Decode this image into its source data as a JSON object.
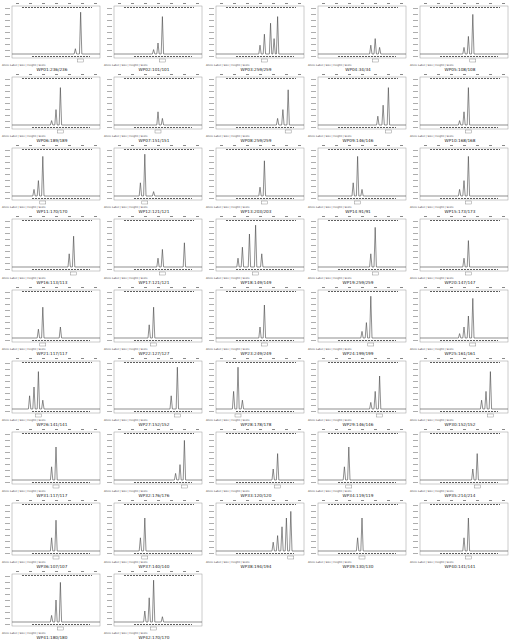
{
  "chart_data": {
    "type": "line",
    "title": "",
    "layout": {
      "columns": 5,
      "rows": 9,
      "panel_count": 42
    },
    "panel_footer_labels": [
      "Allele Label",
      "Size",
      "Height",
      "Score"
    ],
    "panels": [
      {
        "name": "WP01:236/236",
        "peaks": [
          [
            0.78,
            0.95
          ],
          [
            0.72,
            0.12
          ]
        ]
      },
      {
        "name": "WP02:101/101",
        "peaks": [
          [
            0.55,
            0.85
          ],
          [
            0.5,
            0.25
          ],
          [
            0.45,
            0.1
          ]
        ]
      },
      {
        "name": "WP03:259/259",
        "peaks": [
          [
            0.55,
            0.45
          ],
          [
            0.62,
            0.7
          ],
          [
            0.7,
            0.85
          ],
          [
            0.5,
            0.2
          ],
          [
            0.66,
            0.35
          ]
        ]
      },
      {
        "name": "WP04:34/34",
        "peaks": [
          [
            0.65,
            0.35
          ],
          [
            0.6,
            0.2
          ],
          [
            0.7,
            0.15
          ]
        ]
      },
      {
        "name": "WP05:108/108",
        "peaks": [
          [
            0.6,
            0.9
          ],
          [
            0.55,
            0.4
          ],
          [
            0.5,
            0.15
          ]
        ]
      },
      {
        "name": "WP06:189/189",
        "peaks": [
          [
            0.55,
            0.85
          ],
          [
            0.5,
            0.35
          ],
          [
            0.45,
            0.1
          ]
        ]
      },
      {
        "name": "WP07:151/151",
        "peaks": [
          [
            0.5,
            0.3
          ],
          [
            0.55,
            0.15
          ]
        ]
      },
      {
        "name": "WP08:259/259",
        "peaks": [
          [
            0.82,
            0.8
          ],
          [
            0.76,
            0.35
          ],
          [
            0.7,
            0.15
          ]
        ]
      },
      {
        "name": "WP09:146/146",
        "peaks": [
          [
            0.8,
            0.85
          ],
          [
            0.74,
            0.45
          ],
          [
            0.68,
            0.2
          ]
        ]
      },
      {
        "name": "WP10:168/168",
        "peaks": [
          [
            0.55,
            0.85
          ],
          [
            0.5,
            0.3
          ],
          [
            0.45,
            0.1
          ]
        ]
      },
      {
        "name": "WP11:170/170",
        "peaks": [
          [
            0.35,
            0.9
          ],
          [
            0.3,
            0.35
          ],
          [
            0.25,
            0.15
          ]
        ]
      },
      {
        "name": "WP12:121/121",
        "peaks": [
          [
            0.35,
            0.95
          ],
          [
            0.3,
            0.3
          ],
          [
            0.45,
            0.1
          ]
        ]
      },
      {
        "name": "WP13:203/203",
        "peaks": [
          [
            0.55,
            0.8
          ],
          [
            0.5,
            0.2
          ]
        ]
      },
      {
        "name": "WP14:91/91",
        "peaks": [
          [
            0.45,
            0.9
          ],
          [
            0.4,
            0.3
          ],
          [
            0.5,
            0.15
          ]
        ]
      },
      {
        "name": "WP15:173/173",
        "peaks": [
          [
            0.55,
            0.9
          ],
          [
            0.5,
            0.35
          ],
          [
            0.45,
            0.15
          ]
        ]
      },
      {
        "name": "WP16:113/113",
        "peaks": [
          [
            0.7,
            0.7
          ],
          [
            0.65,
            0.3
          ]
        ]
      },
      {
        "name": "WP17:121/121",
        "peaks": [
          [
            0.55,
            0.4
          ],
          [
            0.8,
            0.55
          ],
          [
            0.5,
            0.2
          ]
        ]
      },
      {
        "name": "WP18:149/149",
        "peaks": [
          [
            0.45,
            0.95
          ],
          [
            0.38,
            0.75
          ],
          [
            0.3,
            0.45
          ],
          [
            0.52,
            0.3
          ],
          [
            0.25,
            0.2
          ]
        ]
      },
      {
        "name": "WP19:259/259",
        "peaks": [
          [
            0.65,
            0.9
          ],
          [
            0.6,
            0.3
          ]
        ]
      },
      {
        "name": "WP20:147/147",
        "peaks": [
          [
            0.55,
            0.6
          ],
          [
            0.5,
            0.2
          ]
        ]
      },
      {
        "name": "WP21:117/117",
        "peaks": [
          [
            0.35,
            0.7
          ],
          [
            0.55,
            0.25
          ],
          [
            0.3,
            0.2
          ]
        ]
      },
      {
        "name": "WP22:127/127",
        "peaks": [
          [
            0.45,
            0.7
          ],
          [
            0.4,
            0.3
          ]
        ]
      },
      {
        "name": "WP23:249/249",
        "peaks": [
          [
            0.55,
            0.75
          ],
          [
            0.5,
            0.25
          ]
        ]
      },
      {
        "name": "WP24:199/199",
        "peaks": [
          [
            0.6,
            0.95
          ],
          [
            0.55,
            0.35
          ],
          [
            0.5,
            0.15
          ]
        ]
      },
      {
        "name": "WP25:161/161",
        "peaks": [
          [
            0.6,
            0.9
          ],
          [
            0.55,
            0.5
          ],
          [
            0.5,
            0.25
          ],
          [
            0.45,
            0.1
          ]
        ]
      },
      {
        "name": "WP26:141/141",
        "peaks": [
          [
            0.3,
            0.85
          ],
          [
            0.25,
            0.5
          ],
          [
            0.2,
            0.3
          ],
          [
            0.35,
            0.2
          ]
        ]
      },
      {
        "name": "WP27:152/152",
        "peaks": [
          [
            0.72,
            0.95
          ],
          [
            0.65,
            0.3
          ]
        ]
      },
      {
        "name": "WP28:178/178",
        "peaks": [
          [
            0.25,
            0.95
          ],
          [
            0.2,
            0.4
          ],
          [
            0.3,
            0.2
          ]
        ]
      },
      {
        "name": "WP29:146/146",
        "peaks": [
          [
            0.7,
            0.75
          ],
          [
            0.65,
            0.4
          ],
          [
            0.6,
            0.15
          ]
        ]
      },
      {
        "name": "WP30:152/152",
        "peaks": [
          [
            0.8,
            0.85
          ],
          [
            0.75,
            0.4
          ],
          [
            0.7,
            0.2
          ]
        ]
      },
      {
        "name": "WP31:117/117",
        "peaks": [
          [
            0.5,
            0.75
          ],
          [
            0.45,
            0.3
          ]
        ]
      },
      {
        "name": "WP32:176/176",
        "peaks": [
          [
            0.8,
            0.9
          ],
          [
            0.75,
            0.35
          ],
          [
            0.7,
            0.15
          ]
        ]
      },
      {
        "name": "WP33:120/120",
        "peaks": [
          [
            0.7,
            0.6
          ],
          [
            0.65,
            0.25
          ]
        ]
      },
      {
        "name": "WP34:119/119",
        "peaks": [
          [
            0.35,
            0.75
          ],
          [
            0.3,
            0.3
          ]
        ]
      },
      {
        "name": "WP35:214/214",
        "peaks": [
          [
            0.65,
            0.6
          ],
          [
            0.6,
            0.25
          ]
        ]
      },
      {
        "name": "WP36:107/107",
        "peaks": [
          [
            0.5,
            0.7
          ],
          [
            0.45,
            0.3
          ]
        ]
      },
      {
        "name": "WP37:140/140",
        "peaks": [
          [
            0.35,
            0.75
          ],
          [
            0.3,
            0.3
          ]
        ]
      },
      {
        "name": "WP38:194/194",
        "peaks": [
          [
            0.85,
            0.9
          ],
          [
            0.8,
            0.75
          ],
          [
            0.75,
            0.55
          ],
          [
            0.7,
            0.35
          ],
          [
            0.65,
            0.2
          ]
        ]
      },
      {
        "name": "WP39:130/130",
        "peaks": [
          [
            0.5,
            0.75
          ],
          [
            0.45,
            0.3
          ]
        ]
      },
      {
        "name": "WP40:141/141",
        "peaks": [
          [
            0.55,
            0.75
          ],
          [
            0.5,
            0.3
          ]
        ]
      },
      {
        "name": "WP41:180/180",
        "peaks": [
          [
            0.55,
            0.9
          ],
          [
            0.5,
            0.5
          ],
          [
            0.45,
            0.15
          ]
        ]
      },
      {
        "name": "WP42:170/170",
        "peaks": [
          [
            0.45,
            0.95
          ],
          [
            0.4,
            0.55
          ],
          [
            0.35,
            0.25
          ],
          [
            0.55,
            0.12
          ]
        ]
      }
    ]
  }
}
